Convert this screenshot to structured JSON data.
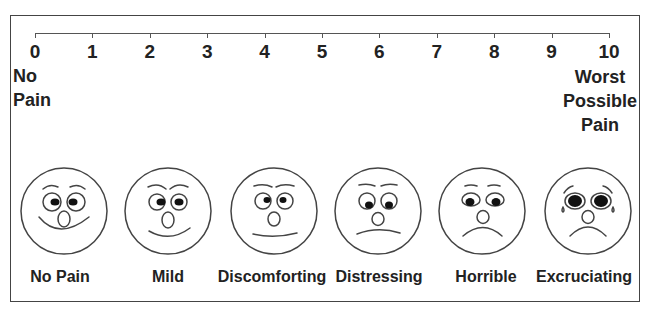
{
  "scale": {
    "min": 0,
    "max": 10,
    "ticks": [
      "0",
      "1",
      "2",
      "3",
      "4",
      "5",
      "6",
      "7",
      "8",
      "9",
      "10"
    ],
    "left_anchor": [
      "No",
      "Pain"
    ],
    "right_anchor": [
      "Worst",
      "Possible",
      "Pain"
    ]
  },
  "faces": [
    {
      "label": "No Pain",
      "expression": "big-smile"
    },
    {
      "label": "Mild",
      "expression": "smile"
    },
    {
      "label": "Discomforting",
      "expression": "flat"
    },
    {
      "label": "Distressing",
      "expression": "slight-frown"
    },
    {
      "label": "Horrible",
      "expression": "frown"
    },
    {
      "label": "Excruciating",
      "expression": "crying-frown"
    }
  ],
  "colors": {
    "line": "#444444",
    "text": "#222222",
    "background": "#ffffff"
  }
}
